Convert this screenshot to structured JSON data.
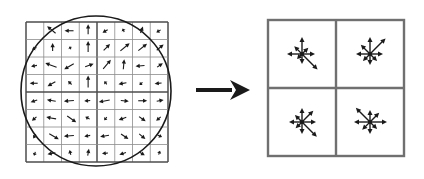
{
  "figure": {
    "type": "diagram",
    "background_color": "#ffffff",
    "stroke_color": "#1a1a1a",
    "grid_color": "#8c8c8c",
    "grid_bold_color": "#4d4d4d",
    "panel_border_color": "#707070"
  },
  "left_panel": {
    "name": "image-gradients",
    "caption": "",
    "grid": {
      "x": 26,
      "y": 22,
      "width": 142,
      "height": 140,
      "cols": 8,
      "rows": 8,
      "bold_divider_cols": [
        4
      ],
      "bold_divider_rows": [
        4
      ]
    },
    "gaussian_window": {
      "shape": "circle",
      "cx": 96,
      "cy": 91,
      "r": 75,
      "stroke_width": 1.6
    },
    "gradients": [
      {
        "col": 0,
        "row": 0,
        "angle": -60,
        "len": 0
      },
      {
        "col": 1,
        "row": 0,
        "angle": -140,
        "len": 11
      },
      {
        "col": 2,
        "row": 0,
        "angle": 180,
        "len": 9
      },
      {
        "col": 3,
        "row": 0,
        "angle": -90,
        "len": 10
      },
      {
        "col": 4,
        "row": 0,
        "angle": 150,
        "len": 6
      },
      {
        "col": 5,
        "row": 0,
        "angle": -115,
        "len": 4
      },
      {
        "col": 6,
        "row": 0,
        "angle": -70,
        "len": 7
      },
      {
        "col": 7,
        "row": 0,
        "angle": 150,
        "len": 5
      },
      {
        "col": 0,
        "row": 1,
        "angle": 155,
        "len": 5
      },
      {
        "col": 1,
        "row": 1,
        "angle": -90,
        "len": 8
      },
      {
        "col": 2,
        "row": 1,
        "angle": -120,
        "len": 3
      },
      {
        "col": 3,
        "row": 1,
        "angle": -90,
        "len": 11
      },
      {
        "col": 4,
        "row": 1,
        "angle": -45,
        "len": 9
      },
      {
        "col": 5,
        "row": 1,
        "angle": -40,
        "len": 12
      },
      {
        "col": 6,
        "row": 1,
        "angle": -38,
        "len": 11
      },
      {
        "col": 7,
        "row": 1,
        "angle": -40,
        "len": 9
      },
      {
        "col": 0,
        "row": 2,
        "angle": 170,
        "len": 6
      },
      {
        "col": 1,
        "row": 2,
        "angle": -160,
        "len": 12
      },
      {
        "col": 2,
        "row": 2,
        "angle": 150,
        "len": 11
      },
      {
        "col": 3,
        "row": 2,
        "angle": -20,
        "len": 9
      },
      {
        "col": 4,
        "row": 2,
        "angle": -50,
        "len": 12
      },
      {
        "col": 5,
        "row": 2,
        "angle": -85,
        "len": 10
      },
      {
        "col": 6,
        "row": 2,
        "angle": 175,
        "len": 9
      },
      {
        "col": 7,
        "row": 2,
        "angle": -35,
        "len": 7
      },
      {
        "col": 0,
        "row": 3,
        "angle": 180,
        "len": 8
      },
      {
        "col": 1,
        "row": 3,
        "angle": 150,
        "len": 9
      },
      {
        "col": 2,
        "row": 3,
        "angle": -135,
        "len": 5
      },
      {
        "col": 3,
        "row": 3,
        "angle": -90,
        "len": 12
      },
      {
        "col": 4,
        "row": 3,
        "angle": -130,
        "len": 4
      },
      {
        "col": 5,
        "row": 3,
        "angle": 170,
        "len": 8
      },
      {
        "col": 6,
        "row": 3,
        "angle": 140,
        "len": 4
      },
      {
        "col": 7,
        "row": 3,
        "angle": 175,
        "len": 7
      },
      {
        "col": 0,
        "row": 4,
        "angle": 160,
        "len": 7
      },
      {
        "col": 1,
        "row": 4,
        "angle": -170,
        "len": 9
      },
      {
        "col": 2,
        "row": 4,
        "angle": 175,
        "len": 10
      },
      {
        "col": 3,
        "row": 4,
        "angle": 175,
        "len": 6
      },
      {
        "col": 4,
        "row": 4,
        "angle": 170,
        "len": 11
      },
      {
        "col": 5,
        "row": 4,
        "angle": 5,
        "len": 8
      },
      {
        "col": 6,
        "row": 4,
        "angle": 0,
        "len": 9
      },
      {
        "col": 7,
        "row": 4,
        "angle": -10,
        "len": 7
      },
      {
        "col": 0,
        "row": 5,
        "angle": 140,
        "len": 6
      },
      {
        "col": 1,
        "row": 5,
        "angle": -170,
        "len": 10
      },
      {
        "col": 2,
        "row": 5,
        "angle": 35,
        "len": 11
      },
      {
        "col": 3,
        "row": 5,
        "angle": -150,
        "len": 5
      },
      {
        "col": 4,
        "row": 5,
        "angle": 130,
        "len": 4
      },
      {
        "col": 5,
        "row": 5,
        "angle": 160,
        "len": 8
      },
      {
        "col": 6,
        "row": 5,
        "angle": 35,
        "len": 8
      },
      {
        "col": 7,
        "row": 5,
        "angle": 140,
        "len": 6
      },
      {
        "col": 0,
        "row": 6,
        "angle": 120,
        "len": 5
      },
      {
        "col": 1,
        "row": 6,
        "angle": 30,
        "len": 11
      },
      {
        "col": 2,
        "row": 6,
        "angle": 175,
        "len": 10
      },
      {
        "col": 3,
        "row": 6,
        "angle": 170,
        "len": 6
      },
      {
        "col": 4,
        "row": 6,
        "angle": 170,
        "len": 9
      },
      {
        "col": 5,
        "row": 6,
        "angle": 35,
        "len": 9
      },
      {
        "col": 6,
        "row": 6,
        "angle": 40,
        "len": 8
      },
      {
        "col": 7,
        "row": 6,
        "angle": 25,
        "len": 5
      },
      {
        "col": 0,
        "row": 7,
        "angle": 110,
        "len": 4
      },
      {
        "col": 1,
        "row": 7,
        "angle": 170,
        "len": 8
      },
      {
        "col": 2,
        "row": 7,
        "angle": -105,
        "len": 5
      },
      {
        "col": 3,
        "row": 7,
        "angle": -80,
        "len": 7
      },
      {
        "col": 4,
        "row": 7,
        "angle": 175,
        "len": 6
      },
      {
        "col": 5,
        "row": 7,
        "angle": 160,
        "len": 7
      },
      {
        "col": 6,
        "row": 7,
        "angle": 30,
        "len": 6
      },
      {
        "col": 7,
        "row": 7,
        "angle": -70,
        "len": 4
      }
    ]
  },
  "transition_arrow": {
    "name": "rightward-arrow",
    "x1": 196,
    "y1": 90,
    "x2": 250,
    "y2": 90,
    "shaft_width": 4,
    "head_width": 20,
    "head_length": 20
  },
  "right_panel": {
    "name": "keypoint-descriptor",
    "caption": "",
    "box": {
      "x": 268,
      "y": 20,
      "width": 136,
      "height": 136
    },
    "cells": 2,
    "bins": 8,
    "bin_angles_deg": [
      0,
      45,
      90,
      135,
      180,
      225,
      270,
      315
    ],
    "histograms": [
      {
        "cell": "top-left",
        "cx": 302,
        "cy": 54,
        "magnitudes": [
          13,
          9,
          17,
          11,
          15,
          7,
          10,
          22
        ]
      },
      {
        "cell": "top-right",
        "cx": 370,
        "cy": 54,
        "magnitudes": [
          13,
          22,
          17,
          13,
          14,
          10,
          11,
          10
        ]
      },
      {
        "cell": "bottom-left",
        "cx": 302,
        "cy": 122,
        "magnitudes": [
          14,
          16,
          14,
          10,
          13,
          9,
          12,
          21
        ]
      },
      {
        "cell": "bottom-right",
        "cx": 370,
        "cy": 122,
        "magnitudes": [
          17,
          13,
          12,
          20,
          16,
          11,
          12,
          10
        ]
      }
    ]
  }
}
